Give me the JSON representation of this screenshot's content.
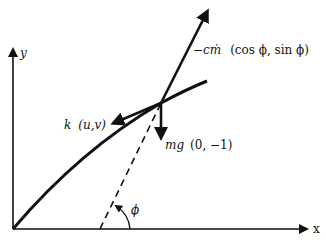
{
  "diagram": {
    "type": "free-body trajectory diagram",
    "axes": {
      "x_label": "x",
      "y_label": "y"
    },
    "forces": {
      "thrust": {
        "coef": "−cṁ",
        "vector": "(cos ϕ, sin ϕ)"
      },
      "drag": {
        "coef": "k",
        "vector": "(u,v)"
      },
      "gravity": {
        "coef": "mg",
        "vector": "(0, −1)"
      }
    },
    "angle_label": "ϕ",
    "colors": {
      "ink": "#111111",
      "background": "#ffffff"
    }
  }
}
